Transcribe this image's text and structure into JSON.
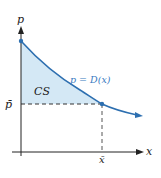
{
  "diagram": {
    "type": "consumer-surplus",
    "y_axis_label": "p",
    "x_axis_label": "x",
    "curve_label": "p = D(x)",
    "region_label": "CS",
    "equilibrium_price_label": "p̄",
    "equilibrium_quantity_label": "x̄",
    "colors": {
      "curve": "#2d6fb0",
      "region_fill": "#d4e8f5",
      "axes": "#222222",
      "dashed": "#333333",
      "curve_label": "#3a7bbf"
    }
  }
}
